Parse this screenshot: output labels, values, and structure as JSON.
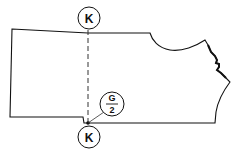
{
  "diagram": {
    "type": "sewing-pattern-piece",
    "labels": {
      "top_marker": "K",
      "bottom_marker": "K",
      "callout_numerator": "G",
      "callout_denominator": "2"
    },
    "colors": {
      "stroke": "#111111",
      "background": "#ffffff"
    }
  }
}
